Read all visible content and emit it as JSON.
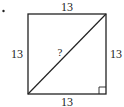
{
  "figure": {
    "bullet": "•",
    "shape": "square",
    "side_top": "13",
    "side_left": "13",
    "side_right": "13",
    "side_bottom": "13",
    "diagonal_label": "?",
    "right_angle_marker": "bottom-right",
    "colors": {
      "stroke": "#222222",
      "background": "#ffffff"
    }
  }
}
